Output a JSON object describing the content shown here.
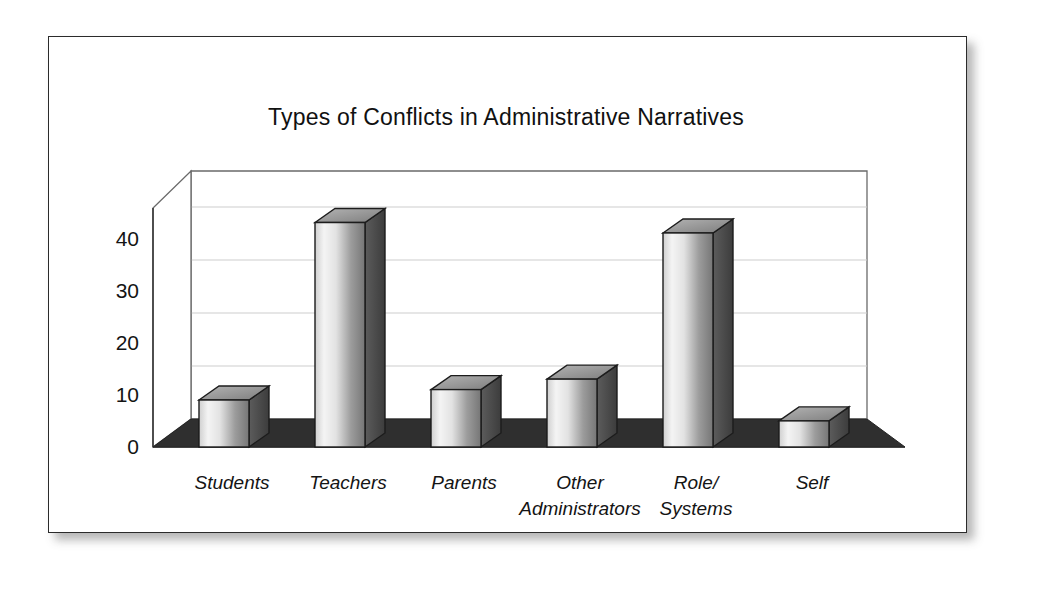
{
  "figure": {
    "title": "Types of Conflicts in Administrative Narratives",
    "background_color": "#ffffff",
    "frame_color": "#2b2b2b",
    "floor_color": "#2f2f2f",
    "wall_color": "#ffffff",
    "gridline_color": "#c9c9c9",
    "bar_light": "#f2f2f2",
    "bar_dark": "#6e6e6e",
    "bar_top_color": "#9a9a9a",
    "bar_side_color": "#4a4a4a",
    "bar_outline_color": "#1c1c1c"
  },
  "chart_data": {
    "type": "bar",
    "title": "Types of Conflicts in Administrative Narratives",
    "xlabel": "",
    "ylabel": "",
    "categories": [
      "Students",
      "Teachers",
      "Parents",
      "Other Administrators",
      "Role/ Systems",
      "Self"
    ],
    "category_lines": [
      [
        "Students"
      ],
      [
        "Teachers"
      ],
      [
        "Parents"
      ],
      [
        "Other",
        "Administrators"
      ],
      [
        "Role/",
        "Systems"
      ],
      [
        "Self"
      ]
    ],
    "values": [
      9,
      43,
      11,
      13,
      41,
      5
    ],
    "ylim": [
      0,
      47
    ],
    "yticks": [
      0,
      10,
      20,
      30,
      40
    ],
    "ytick_labels": [
      "0",
      "10",
      "20",
      "30",
      "40"
    ],
    "grid": true,
    "grid_axis": "y",
    "legend": false,
    "style_3d": true,
    "series": [
      {
        "name": "Count of narratives",
        "values": [
          9,
          43,
          11,
          13,
          41,
          5
        ]
      }
    ]
  }
}
